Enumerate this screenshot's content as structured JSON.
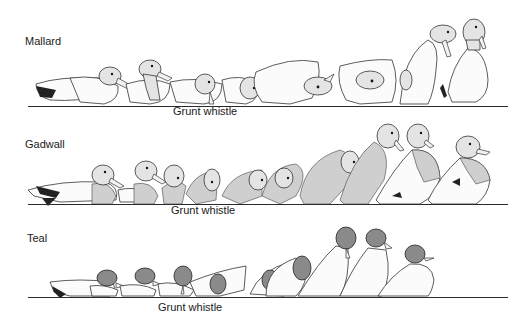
{
  "figure": {
    "rows": [
      {
        "species": "Mallard",
        "caption": "Grunt whistle",
        "stage_count": 9
      },
      {
        "species": "Gadwall",
        "caption": "Grunt whistle",
        "stage_count": 11
      },
      {
        "species": "Teal",
        "caption": "Grunt whistle",
        "stage_count": 9
      }
    ]
  }
}
